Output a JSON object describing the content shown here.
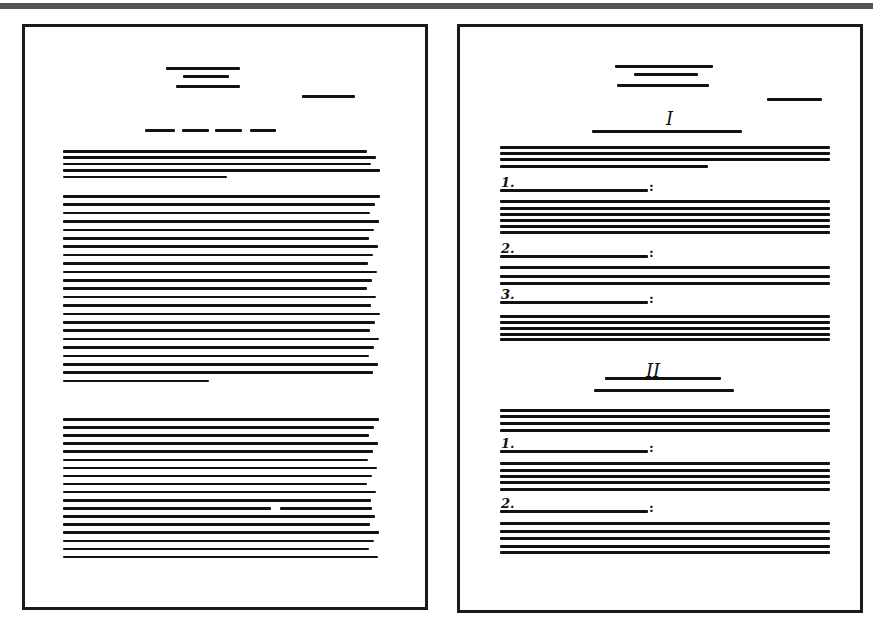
{
  "figure": {
    "left_page": {
      "style": "continuous prose",
      "header_lines": 3,
      "date_line": true,
      "title_dashes": 4,
      "paragraph_line_counts": [
        5,
        23,
        18
      ]
    },
    "right_page": {
      "style": "structured sections with numbered points",
      "header_lines": 3,
      "date_line": true,
      "sections": [
        {
          "numeral": "I",
          "intro_lines": 4,
          "points": [
            {
              "label": "1.",
              "colon": ":",
              "lines": 6
            },
            {
              "label": "2.",
              "colon": ":",
              "lines": 3
            },
            {
              "label": "3.",
              "colon": ":",
              "lines": 5
            }
          ]
        },
        {
          "numeral": "II",
          "intro_lines": 4,
          "points": [
            {
              "label": "1.",
              "colon": ":",
              "lines": 5
            },
            {
              "label": "2.",
              "colon": ":",
              "lines": 5
            }
          ]
        }
      ]
    }
  }
}
